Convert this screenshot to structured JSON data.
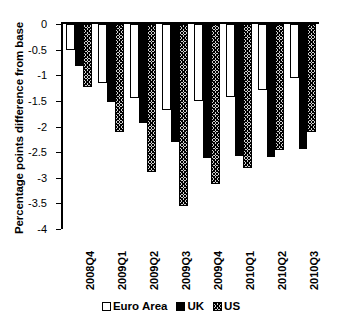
{
  "chart_data": {
    "type": "bar",
    "title": "",
    "xlabel": "",
    "ylabel": "Percentage points difference from base",
    "ylim": [
      -4,
      0
    ],
    "ytick_step": 0.5,
    "grid": false,
    "legend_position": "bottom",
    "orientation": "vertical",
    "categories": [
      "2008Q4",
      "2009Q1",
      "2009Q2",
      "2009Q3",
      "2009Q4",
      "2010Q1",
      "2010Q2",
      "2010Q3"
    ],
    "ytick_labels": [
      "0",
      "-0.5",
      "-1",
      "-1.5",
      "-2",
      "-2.5",
      "-3",
      "-3.5",
      "-4"
    ],
    "ytick_values": [
      0,
      -0.5,
      -1,
      -1.5,
      -2,
      -2.5,
      -3,
      -3.5,
      -4
    ],
    "series": [
      {
        "name": "Euro Area",
        "fill": "white",
        "color": "#ffffff",
        "values": [
          -0.5,
          -1.15,
          -1.45,
          -1.68,
          -1.5,
          -1.43,
          -1.28,
          -1.05
        ]
      },
      {
        "name": "UK",
        "fill": "solid-black",
        "color": "#000000",
        "values": [
          -0.82,
          -1.52,
          -1.93,
          -2.3,
          -2.62,
          -2.58,
          -2.6,
          -2.43
        ]
      },
      {
        "name": "US",
        "fill": "hatched-gray",
        "color": "#cfcfcf",
        "values": [
          -1.22,
          -2.1,
          -2.88,
          -3.55,
          -3.12,
          -2.8,
          -2.45,
          -2.1
        ]
      }
    ]
  }
}
